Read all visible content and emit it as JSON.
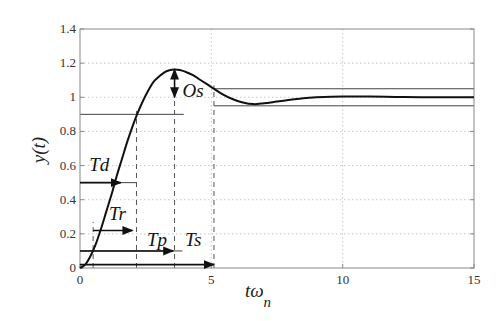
{
  "chart_data": {
    "type": "line",
    "title": "",
    "xlabel": "tω_n",
    "xlabel_main": "tω",
    "xlabel_sub": "n",
    "ylabel": "y(t)",
    "xlim": [
      0,
      15
    ],
    "ylim": [
      0,
      1.4
    ],
    "grid": true,
    "x_ticks": [
      0,
      5,
      10,
      15
    ],
    "x_tick_labels": [
      "0",
      "5",
      "10",
      "15"
    ],
    "y_ticks": [
      0,
      0.2,
      0.4,
      0.6,
      0.8,
      1.0,
      1.2,
      1.4
    ],
    "y_tick_labels": [
      "0",
      "0.2",
      "0.4",
      "0.6",
      "0.8",
      "1",
      "1.2",
      "1.4"
    ],
    "series": [
      {
        "name": "step response",
        "x": [
          0,
          0.2,
          0.4,
          0.6,
          0.8,
          1.0,
          1.2,
          1.4,
          1.6,
          1.8,
          2.0,
          2.2,
          2.4,
          2.6,
          2.8,
          3.0,
          3.2,
          3.4,
          3.6,
          3.8,
          4.0,
          4.3,
          4.6,
          5.0,
          5.4,
          5.8,
          6.2,
          6.6,
          7.0,
          7.5,
          8.0,
          8.5,
          9.0,
          10.0,
          11.0,
          12.0,
          13.0,
          14.0,
          15.0
        ],
        "values": [
          0,
          0.02,
          0.07,
          0.14,
          0.23,
          0.33,
          0.43,
          0.54,
          0.64,
          0.74,
          0.83,
          0.91,
          0.98,
          1.04,
          1.09,
          1.12,
          1.145,
          1.158,
          1.163,
          1.16,
          1.15,
          1.13,
          1.1,
          1.06,
          1.02,
          0.99,
          0.97,
          0.96,
          0.965,
          0.975,
          0.985,
          0.995,
          1.0,
          1.005,
          1.004,
          1.002,
          1.0,
          1.0,
          1.0
        ]
      }
    ],
    "reference_lines": [
      {
        "name": "90% level",
        "y": 0.9,
        "x_from": 0,
        "x_to": 3.95
      },
      {
        "name": "50% level (Td)",
        "y": 0.5,
        "x_from": 0,
        "x_to": 2.15
      },
      {
        "name": "10% level (Tp)",
        "y": 0.1,
        "x_from": 0,
        "x_to": 3.9
      },
      {
        "name": "upper settling band",
        "y": 1.05,
        "x_from": 5.1,
        "x_to": 15
      },
      {
        "name": "lower settling band",
        "y": 0.95,
        "x_from": 5.1,
        "x_to": 15
      }
    ],
    "dashed_verticals": [
      {
        "x": 0.5,
        "y_from": 0,
        "y_to": 0.27
      },
      {
        "x": 2.15,
        "y_from": 0,
        "y_to": 0.92
      },
      {
        "x": 3.6,
        "y_from": 0,
        "y_to": 1.163
      },
      {
        "x": 5.1,
        "y_from": 0,
        "y_to": 1.07
      }
    ],
    "annotations": [
      {
        "label": "Td",
        "x": 0.35,
        "y": 0.57,
        "arrow": {
          "from": [
            0,
            0.5
          ],
          "to": [
            1.55,
            0.5
          ]
        }
      },
      {
        "label": "Tr",
        "x": 1.1,
        "y": 0.28,
        "arrow": {
          "from": [
            0.5,
            0.22
          ],
          "to": [
            2.0,
            0.22
          ]
        }
      },
      {
        "label": "Tp",
        "x": 2.55,
        "y": 0.13,
        "arrow": {
          "from": [
            0,
            0.1
          ],
          "to": [
            3.55,
            0.1
          ]
        }
      },
      {
        "label": "Ts",
        "x": 4.0,
        "y": 0.13,
        "arrow": {
          "from": [
            0,
            0.02
          ],
          "to": [
            5.1,
            0.02
          ]
        }
      },
      {
        "label": "Os",
        "x": 3.9,
        "y": 1.0,
        "arrow": {
          "from": [
            3.6,
            1.163
          ],
          "to": [
            3.6,
            1.0
          ],
          "double": true
        }
      }
    ]
  }
}
